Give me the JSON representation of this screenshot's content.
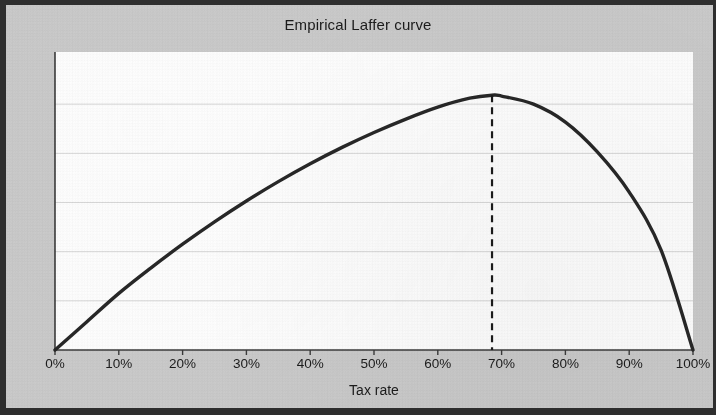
{
  "chart_data": {
    "type": "line",
    "title": "Empirical Laffer curve",
    "xlabel": "Tax rate",
    "ylabel": "Tax revenue",
    "xlim": [
      0,
      100
    ],
    "ylim": [
      0,
      100
    ],
    "grid": "horizontal",
    "legend": "none",
    "x_tick_labels": [
      "0%",
      "10%",
      "20%",
      "30%",
      "40%",
      "50%",
      "60%",
      "70%",
      "80%",
      "90%",
      "100%"
    ],
    "x_tick_values": [
      0,
      10,
      20,
      30,
      40,
      50,
      60,
      70,
      80,
      90,
      100
    ],
    "y_tick_labels": [],
    "y_gridline_values": [
      16.5,
      33,
      49.5,
      66,
      82.5
    ],
    "series": [
      {
        "name": "Laffer curve",
        "color": "#262626",
        "style": "solid",
        "x": [
          0,
          5,
          10,
          15,
          20,
          25,
          30,
          35,
          40,
          45,
          50,
          55,
          60,
          65,
          68.5,
          70,
          75,
          80,
          85,
          90,
          95,
          100
        ],
        "y": [
          0,
          9.5,
          19.0,
          27.5,
          35.5,
          43.0,
          50.0,
          56.5,
          62.5,
          68.0,
          73.0,
          77.5,
          81.5,
          84.5,
          85.5,
          85.2,
          82.5,
          76.5,
          66.5,
          53.0,
          33.5,
          0
        ]
      }
    ],
    "annotations": [
      {
        "name": "revenue-maximizing-rate-marker",
        "type": "vertical-dashed-line",
        "x": 68.5,
        "y_from": 0,
        "y_to": 85.5,
        "color": "#1a1a1a",
        "label": ""
      }
    ]
  }
}
